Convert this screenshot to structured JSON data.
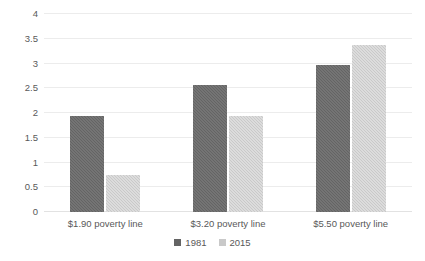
{
  "chart_data": {
    "type": "bar",
    "title": "",
    "subtitle": "",
    "xlabel": "",
    "ylabel": "",
    "categories": [
      "$1.90 poverty line",
      "$3.20 poverty line",
      "$5.50 poverty line"
    ],
    "series": [
      {
        "name": "1981",
        "color": "#646464",
        "values": [
          1.93,
          2.57,
          2.97
        ]
      },
      {
        "name": "2015",
        "color": "#c9c9c9",
        "values": [
          0.75,
          1.94,
          3.38
        ]
      }
    ],
    "ylim": [
      0,
      4
    ],
    "yticks": [
      "0",
      "0.5",
      "1",
      "1.5",
      "2",
      "2.5",
      "3",
      "3.5",
      "4"
    ],
    "ytick_values": [
      0,
      0.5,
      1,
      1.5,
      2,
      2.5,
      3,
      3.5,
      4
    ],
    "grid": true,
    "grid_color": "#ececec",
    "legend_position": "bottom",
    "background": "#ffffff",
    "text_color": "#595959"
  }
}
